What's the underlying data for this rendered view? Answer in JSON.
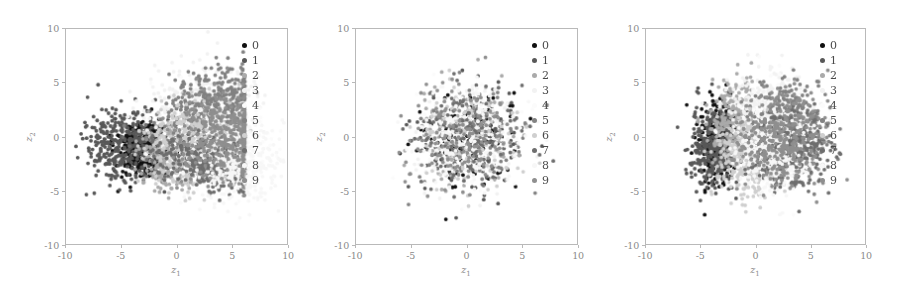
{
  "figure": {
    "type": "scatter-panels",
    "panel_count": 3,
    "axis": {
      "xlabel": "z",
      "xlabel_sub": "1",
      "ylabel": "z",
      "ylabel_sub": "2",
      "xticks": [
        "-10",
        "-5",
        "0",
        "5",
        "10"
      ],
      "yticks": [
        "10",
        "5",
        "0",
        "-5",
        "-10"
      ],
      "xlim": [
        -10,
        10
      ],
      "ylim": [
        -10,
        10
      ],
      "grid": false
    },
    "legend": {
      "position": "upper-right-inside",
      "entries": [
        {
          "label": "0",
          "color": "#101010"
        },
        {
          "label": "1",
          "color": "#585858"
        },
        {
          "label": "2",
          "color": "#aaaaaa"
        },
        {
          "label": "3",
          "color": "#f2f2f2"
        },
        {
          "label": "4",
          "color": "#fbfbfb"
        },
        {
          "label": "5",
          "color": "#828282"
        },
        {
          "label": "6",
          "color": "#cfcfcf"
        },
        {
          "label": "7",
          "color": "#6e6e6e"
        },
        {
          "label": "8",
          "color": "#f7f7f7"
        },
        {
          "label": "9",
          "color": "#8f8f8f"
        }
      ]
    }
  },
  "chart_data": [
    {
      "type": "scatter",
      "title": "",
      "xlabel": "z1",
      "ylabel": "z2",
      "xlim": [
        -10,
        10
      ],
      "ylim": [
        -10,
        10
      ],
      "xticks": [
        -10,
        -5,
        0,
        5,
        10
      ],
      "yticks": [
        -10,
        -5,
        0,
        5,
        10
      ],
      "grid": false,
      "legend": [
        "0",
        "1",
        "2",
        "3",
        "4",
        "5",
        "6",
        "7",
        "8",
        "9"
      ],
      "series": [
        {
          "name": "0",
          "color": "#101010",
          "n": 420,
          "center": [
            -3.0,
            -1.2
          ],
          "spread": [
            1.3,
            1.3
          ],
          "shape": "blob"
        },
        {
          "name": "1",
          "color": "#585858",
          "n": 380,
          "center": [
            -4.6,
            -1.0
          ],
          "spread": [
            1.9,
            1.7
          ],
          "shape": "blob"
        },
        {
          "name": "2",
          "color": "#aaaaaa",
          "n": 400,
          "center": [
            -0.4,
            -1.6
          ],
          "spread": [
            1.3,
            2.1
          ],
          "shape": "wedge"
        },
        {
          "name": "3",
          "color": "#f2f2f2",
          "n": 360,
          "center": [
            2.2,
            2.4
          ],
          "spread": [
            2.4,
            2.2
          ],
          "shape": "blob"
        },
        {
          "name": "4",
          "color": "#fbfbfb",
          "n": 340,
          "center": [
            3.6,
            -0.4
          ],
          "spread": [
            2.4,
            2.4
          ],
          "shape": "blob"
        },
        {
          "name": "5",
          "color": "#828282",
          "n": 420,
          "center": [
            3.3,
            2.6
          ],
          "spread": [
            2.1,
            2.2
          ],
          "shape": "fan"
        },
        {
          "name": "6",
          "color": "#cfcfcf",
          "n": 360,
          "center": [
            1.2,
            -0.6
          ],
          "spread": [
            1.9,
            2.0
          ],
          "shape": "blob"
        },
        {
          "name": "7",
          "color": "#6e6e6e",
          "n": 440,
          "center": [
            3.4,
            -2.6
          ],
          "spread": [
            2.2,
            1.4
          ],
          "shape": "fan"
        },
        {
          "name": "8",
          "color": "#f7f7f7",
          "n": 330,
          "center": [
            5.6,
            -2.4
          ],
          "spread": [
            1.9,
            1.8
          ],
          "shape": "blob"
        },
        {
          "name": "9",
          "color": "#8f8f8f",
          "n": 400,
          "center": [
            4.6,
            0.2
          ],
          "spread": [
            2.2,
            2.6
          ],
          "shape": "fan"
        }
      ],
      "description": "Latent codes fan out radially from a dark cluster on the left toward the right; classes form elongated wedge-shaped sectors with a hard vertical cut near z1=6."
    },
    {
      "type": "scatter",
      "title": "",
      "xlabel": "z1",
      "ylabel": "z2",
      "xlim": [
        -10,
        10
      ],
      "ylim": [
        -10,
        10
      ],
      "xticks": [
        -10,
        -5,
        0,
        5,
        10
      ],
      "yticks": [
        -10,
        -5,
        0,
        5,
        10
      ],
      "grid": false,
      "legend": [
        "0",
        "1",
        "2",
        "3",
        "4",
        "5",
        "6",
        "7",
        "8",
        "9"
      ],
      "series": [
        {
          "name": "0",
          "color": "#101010",
          "n": 130,
          "center": [
            0.0,
            0.0
          ],
          "spread": [
            2.3,
            2.3
          ],
          "shape": "gauss"
        },
        {
          "name": "1",
          "color": "#585858",
          "n": 130,
          "center": [
            0.0,
            0.0
          ],
          "spread": [
            2.3,
            2.3
          ],
          "shape": "gauss"
        },
        {
          "name": "2",
          "color": "#aaaaaa",
          "n": 130,
          "center": [
            0.0,
            0.0
          ],
          "spread": [
            2.3,
            2.3
          ],
          "shape": "gauss"
        },
        {
          "name": "3",
          "color": "#f2f2f2",
          "n": 130,
          "center": [
            0.0,
            0.0
          ],
          "spread": [
            2.3,
            2.3
          ],
          "shape": "gauss"
        },
        {
          "name": "4",
          "color": "#fbfbfb",
          "n": 130,
          "center": [
            0.0,
            0.0
          ],
          "spread": [
            2.3,
            2.3
          ],
          "shape": "gauss"
        },
        {
          "name": "5",
          "color": "#828282",
          "n": 130,
          "center": [
            0.0,
            0.0
          ],
          "spread": [
            2.3,
            2.3
          ],
          "shape": "gauss"
        },
        {
          "name": "6",
          "color": "#cfcfcf",
          "n": 130,
          "center": [
            0.0,
            0.0
          ],
          "spread": [
            2.3,
            2.3
          ],
          "shape": "gauss"
        },
        {
          "name": "7",
          "color": "#6e6e6e",
          "n": 130,
          "center": [
            0.0,
            0.0
          ],
          "spread": [
            2.3,
            2.3
          ],
          "shape": "gauss"
        },
        {
          "name": "8",
          "color": "#f7f7f7",
          "n": 130,
          "center": [
            0.0,
            0.0
          ],
          "spread": [
            2.3,
            2.3
          ],
          "shape": "gauss"
        },
        {
          "name": "9",
          "color": "#8f8f8f",
          "n": 130,
          "center": [
            0.0,
            0.0
          ],
          "spread": [
            2.3,
            2.3
          ],
          "shape": "gauss"
        }
      ],
      "description": "All ten classes fully overlap in a single isotropic Gaussian blob centred on the origin; no class separation is visible."
    },
    {
      "type": "scatter",
      "title": "",
      "xlabel": "z1",
      "ylabel": "z2",
      "xlim": [
        -10,
        10
      ],
      "ylim": [
        -10,
        10
      ],
      "xticks": [
        -10,
        -5,
        0,
        5,
        10
      ],
      "yticks": [
        -10,
        -5,
        0,
        5,
        10
      ],
      "grid": false,
      "legend": [
        "0",
        "1",
        "2",
        "3",
        "4",
        "5",
        "6",
        "7",
        "8",
        "9"
      ],
      "series": [
        {
          "name": "0",
          "color": "#101010",
          "n": 330,
          "center": [
            -3.4,
            -0.6
          ],
          "spread": [
            0.9,
            1.8
          ],
          "shape": "gauss"
        },
        {
          "name": "1",
          "color": "#585858",
          "n": 300,
          "center": [
            -3.9,
            -1.0
          ],
          "spread": [
            1.1,
            2.0
          ],
          "shape": "gauss"
        },
        {
          "name": "2",
          "color": "#aaaaaa",
          "n": 330,
          "center": [
            -1.6,
            1.2
          ],
          "spread": [
            1.3,
            2.0
          ],
          "shape": "gauss"
        },
        {
          "name": "3",
          "color": "#f2f2f2",
          "n": 300,
          "center": [
            1.0,
            2.3
          ],
          "spread": [
            1.8,
            1.9
          ],
          "shape": "gauss"
        },
        {
          "name": "4",
          "color": "#fbfbfb",
          "n": 290,
          "center": [
            2.0,
            0.4
          ],
          "spread": [
            1.9,
            2.0
          ],
          "shape": "gauss"
        },
        {
          "name": "5",
          "color": "#828282",
          "n": 330,
          "center": [
            3.0,
            1.2
          ],
          "spread": [
            1.7,
            2.0
          ],
          "shape": "gauss"
        },
        {
          "name": "6",
          "color": "#cfcfcf",
          "n": 320,
          "center": [
            -0.6,
            -2.0
          ],
          "spread": [
            1.5,
            1.8
          ],
          "shape": "gauss"
        },
        {
          "name": "7",
          "color": "#6e6e6e",
          "n": 340,
          "center": [
            3.2,
            -1.4
          ],
          "spread": [
            1.7,
            1.8
          ],
          "shape": "gauss"
        },
        {
          "name": "8",
          "color": "#f7f7f7",
          "n": 290,
          "center": [
            1.4,
            -1.6
          ],
          "spread": [
            1.6,
            1.8
          ],
          "shape": "gauss"
        },
        {
          "name": "9",
          "color": "#8f8f8f",
          "n": 330,
          "center": [
            2.4,
            -0.2
          ],
          "spread": [
            1.9,
            2.1
          ],
          "shape": "gauss"
        }
      ],
      "description": "Classes partially separate into adjacent sectors inside one compact disc: the dark class 0/1 occupies the left lobe while lighter classes spread across the right half."
    }
  ]
}
